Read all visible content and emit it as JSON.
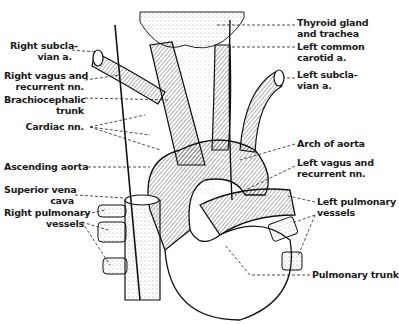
{
  "figure": {
    "type": "anatomical illustration"
  },
  "labels_left": [
    {
      "id": "right-subclavian",
      "lines": [
        "Right subcla-",
        "vian a."
      ]
    },
    {
      "id": "right-vagus",
      "lines": [
        "Right vagus and",
        "recurrent nn."
      ]
    },
    {
      "id": "brachiocephalic",
      "lines": [
        "Brachiocephalic",
        "trunk"
      ]
    },
    {
      "id": "cardiac",
      "lines": [
        "Cardiac nn."
      ]
    },
    {
      "id": "ascending-aorta",
      "lines": [
        "Ascending aorta"
      ]
    },
    {
      "id": "svc",
      "lines": [
        "Superior vena",
        "cava"
      ]
    },
    {
      "id": "right-pulmonary",
      "lines": [
        "Right pulmonary",
        "vessels"
      ]
    }
  ],
  "labels_right": [
    {
      "id": "thyroid",
      "lines": [
        "Thyroid gland",
        "and trachea"
      ]
    },
    {
      "id": "left-carotid",
      "lines": [
        "Left common",
        "carotid a."
      ]
    },
    {
      "id": "left-subclavian",
      "lines": [
        "Left subcla-",
        "vian a."
      ]
    },
    {
      "id": "arch",
      "lines": [
        "Arch of aorta"
      ]
    },
    {
      "id": "left-vagus",
      "lines": [
        "Left vagus and",
        "recurrent nn."
      ]
    },
    {
      "id": "left-pulmonary",
      "lines": [
        "Left pulmonary",
        "vessels"
      ]
    },
    {
      "id": "pulmonary-trunk",
      "lines": [
        "Pulmonary trunk"
      ]
    }
  ],
  "colors": {
    "ink": "#1a1a1a",
    "background": "#ffffff",
    "stipple": "#888888"
  }
}
